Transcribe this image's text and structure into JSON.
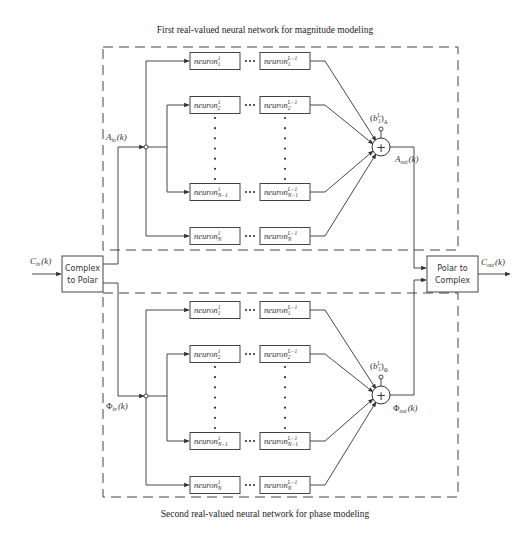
{
  "captions": {
    "top": "First real-valued neural network for magnitude modeling",
    "bottom": "Second real-valued neural network for phase modeling"
  },
  "blocks": {
    "complex_to_polar": [
      "Complex",
      "to Polar"
    ],
    "polar_to_complex": [
      "Polar to",
      "Complex"
    ]
  },
  "signals": {
    "input": {
      "symbol": "C",
      "sub": "in",
      "arg": "(k)"
    },
    "output": {
      "symbol": "C",
      "sub": "out",
      "arg": "(k)"
    },
    "magnitude_in": {
      "symbol": "A",
      "sub": "in",
      "arg": "(k)"
    },
    "magnitude_out": {
      "symbol": "A",
      "sub": "out",
      "arg": "(k)"
    },
    "phase_in": {
      "symbol": "Φ",
      "sub": "in",
      "arg": "(k)"
    },
    "phase_out": {
      "symbol": "Φ",
      "sub": "out",
      "arg": "(k)"
    }
  },
  "bias": {
    "magnitude": {
      "symbol": "b",
      "sup": "L",
      "sub": "1",
      "outer_sub": "A"
    },
    "phase": {
      "symbol": "b",
      "sup": "L",
      "sub": "1",
      "outer_sub": "Φ"
    }
  },
  "networks": [
    {
      "id": "magnitude",
      "rows": [
        {
          "first": {
            "base": "neuron",
            "sup": "1",
            "sub": "1"
          },
          "last": {
            "base": "neuron",
            "sup": "L−1",
            "sub": "1"
          }
        },
        {
          "first": {
            "base": "neuron",
            "sup": "1",
            "sub": "2"
          },
          "last": {
            "base": "neuron",
            "sup": "L−1",
            "sub": "2"
          }
        },
        {
          "first": {
            "base": "neuron",
            "sup": "1",
            "sub": "N−1"
          },
          "last": {
            "base": "neuron",
            "sup": "L−1",
            "sub": "N−1"
          }
        },
        {
          "first": {
            "base": "neuron",
            "sup": "1",
            "sub": "N"
          },
          "last": {
            "base": "neuron",
            "sup": "L−1",
            "sub": "N"
          }
        }
      ]
    },
    {
      "id": "phase",
      "rows": [
        {
          "first": {
            "base": "neuron",
            "sup": "1",
            "sub": "1"
          },
          "last": {
            "base": "neuron",
            "sup": "L−1",
            "sub": "1"
          }
        },
        {
          "first": {
            "base": "neuron",
            "sup": "1",
            "sub": "2"
          },
          "last": {
            "base": "neuron",
            "sup": "L−1",
            "sub": "2"
          }
        },
        {
          "first": {
            "base": "neuron",
            "sup": "1",
            "sub": "N−1"
          },
          "last": {
            "base": "neuron",
            "sup": "L−1",
            "sub": "N−1"
          }
        },
        {
          "first": {
            "base": "neuron",
            "sup": "1",
            "sub": "N"
          },
          "last": {
            "base": "neuron",
            "sup": "L−1",
            "sub": "N"
          }
        }
      ]
    }
  ],
  "summing_symbol": "+"
}
